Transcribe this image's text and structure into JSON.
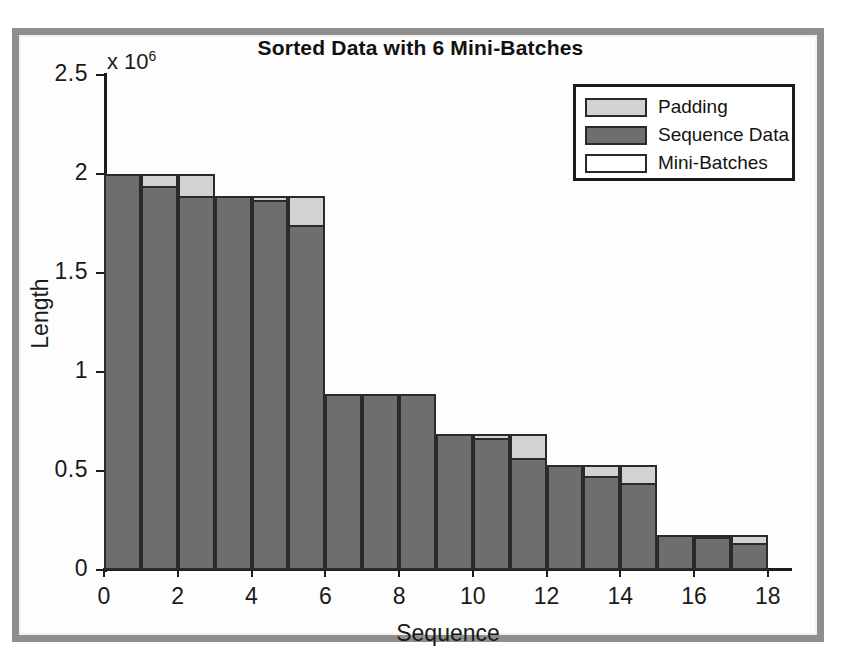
{
  "chart_data": {
    "type": "bar",
    "title": "Sorted Data with 6 Mini-Batches",
    "xlabel": "Sequence",
    "ylabel": "Length",
    "exponent_label": "x 10",
    "exponent_power": "6",
    "y_scale_factor": 1000000,
    "xlim": [
      0,
      18.6
    ],
    "ylim": [
      0,
      2.5
    ],
    "yticks": [
      0,
      0.5,
      1,
      1.5,
      2,
      2.5
    ],
    "ytick_labels": [
      "0",
      "0.5",
      "1",
      "1.5",
      "2",
      "2.5"
    ],
    "xticks": [
      0,
      2,
      4,
      6,
      8,
      10,
      12,
      14,
      16,
      18
    ],
    "xtick_labels": [
      "0",
      "2",
      "4",
      "6",
      "8",
      "10",
      "12",
      "14",
      "16",
      "18"
    ],
    "grid": false,
    "legend_position": "top-right",
    "legend": [
      {
        "label": "Padding",
        "color": "#d2d2d2"
      },
      {
        "label": "Sequence Data",
        "color": "#6e6e6e"
      },
      {
        "label": "Mini-Batches",
        "color": "#ffffff"
      }
    ],
    "mini_batch_count": 6,
    "mini_batch_size": 3,
    "categories": [
      1,
      2,
      3,
      4,
      5,
      6,
      7,
      8,
      9,
      10,
      11,
      12,
      13,
      14,
      15,
      16,
      17,
      18
    ],
    "series": [
      {
        "name": "Sequence Data",
        "values": [
          2.0,
          1.94,
          1.89,
          1.89,
          1.87,
          1.74,
          0.89,
          0.89,
          0.89,
          0.685,
          0.665,
          0.565,
          0.53,
          0.475,
          0.44,
          0.175,
          0.165,
          0.135
        ]
      },
      {
        "name": "Mini-Batches",
        "values": [
          2.0,
          2.0,
          2.0,
          1.89,
          1.89,
          1.89,
          0.89,
          0.89,
          0.89,
          0.685,
          0.685,
          0.685,
          0.53,
          0.53,
          0.53,
          0.175,
          0.175,
          0.175
        ]
      }
    ],
    "batch_tops": [
      2.0,
      1.89,
      0.89,
      0.685,
      0.53,
      0.175
    ]
  },
  "colors": {
    "padding": "#d2d2d2",
    "sequence_data": "#6e6e6e",
    "mini_batches": "#ffffff",
    "axis": "#1c1c1c",
    "frame": "#8e8e8e"
  }
}
